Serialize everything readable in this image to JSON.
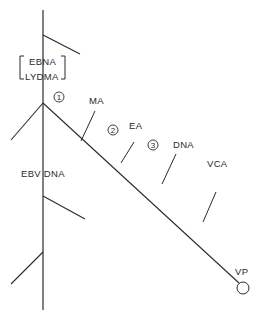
{
  "diagram": {
    "type": "schematic-pathway",
    "colors": {
      "stroke": "#2a2a2a",
      "background": "#ffffff"
    },
    "bracket_labels": [
      "EBNA",
      "LYDMA"
    ],
    "main_axis_label": "EBV DNA",
    "diagonal_labels": {
      "ma": "MA",
      "ea": "EA",
      "dna": "DNA",
      "vca": "VCA",
      "vp": "VP"
    },
    "steps": [
      "1",
      "2",
      "3"
    ]
  }
}
